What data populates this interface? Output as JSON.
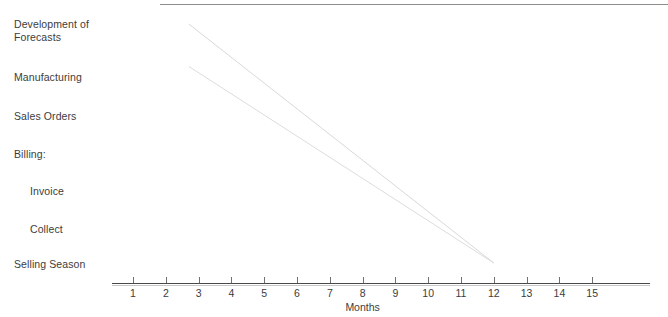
{
  "chart_data": {
    "type": "line",
    "title": "",
    "subtitle": "",
    "xlabel": "Months",
    "ylabel": "",
    "grid": false,
    "legend": null,
    "xlim": [
      0,
      16
    ],
    "x_ticks": [
      1,
      2,
      3,
      4,
      5,
      6,
      7,
      8,
      9,
      10,
      11,
      12,
      13,
      14,
      15
    ],
    "x_tick_labels": [
      "1",
      "2",
      "3",
      "4",
      "5",
      "6",
      "7",
      "8",
      "9",
      "10",
      "11",
      "12",
      "13",
      "14",
      "15"
    ],
    "y_categories": [
      "Development of\nForecasts",
      "Manufacturing",
      "Sales Orders",
      "Billing:",
      "Invoice",
      "Collect",
      "Selling Season"
    ],
    "y_category_indent": [
      false,
      false,
      false,
      false,
      true,
      true,
      false
    ],
    "series": [
      {
        "name": "schedule-line-upper",
        "points": [
          [
            2.7,
            0.0
          ],
          [
            12.0,
            6.1
          ]
        ],
        "color": "#d8d8d8"
      },
      {
        "name": "schedule-line-lower",
        "points": [
          [
            2.7,
            0.8
          ],
          [
            12.0,
            7.3
          ]
        ],
        "color": "#dcdcdc"
      }
    ],
    "annotations": []
  },
  "labels": {
    "rows": [
      {
        "text": "Development of\nForecasts",
        "indent": false
      },
      {
        "text": "Manufacturing",
        "indent": false
      },
      {
        "text": "Sales Orders",
        "indent": false
      },
      {
        "text": "Billing:",
        "indent": false
      },
      {
        "text": "Invoice",
        "indent": true
      },
      {
        "text": "Collect",
        "indent": true
      },
      {
        "text": "Selling Season",
        "indent": false
      }
    ]
  },
  "axis": {
    "title": "Months",
    "ticks": [
      "1",
      "2",
      "3",
      "4",
      "5",
      "6",
      "7",
      "8",
      "9",
      "10",
      "11",
      "12",
      "13",
      "14",
      "15"
    ]
  },
  "colors": {
    "text": "#3c3c3c",
    "axis": "#4a4a4a",
    "rule": "#8d8d8d",
    "series": "#d8d8d8",
    "background": "#ffffff"
  }
}
